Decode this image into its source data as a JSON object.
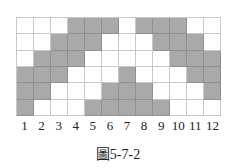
{
  "chart_data": {
    "type": "heatmap",
    "title": "圖5-7-2",
    "columns": [
      "1",
      "2",
      "3",
      "4",
      "5",
      "6",
      "7",
      "8",
      "9",
      "10",
      "11",
      "12"
    ],
    "rows": [
      [
        0,
        0,
        0,
        1,
        1,
        1,
        0,
        1,
        1,
        1,
        0,
        0
      ],
      [
        0,
        0,
        1,
        1,
        1,
        0,
        0,
        0,
        1,
        1,
        1,
        0
      ],
      [
        0,
        1,
        1,
        1,
        0,
        0,
        0,
        0,
        0,
        1,
        1,
        1
      ],
      [
        1,
        1,
        1,
        0,
        0,
        0,
        1,
        0,
        0,
        0,
        1,
        1
      ],
      [
        1,
        1,
        0,
        0,
        0,
        1,
        1,
        1,
        0,
        0,
        0,
        1
      ],
      [
        1,
        0,
        0,
        0,
        1,
        1,
        1,
        1,
        1,
        0,
        0,
        0
      ]
    ],
    "colors": {
      "filled": "#a9a9a9",
      "empty": "#ffffff",
      "grid": "#c8c8c8"
    }
  },
  "caption": "圖5-7-2"
}
